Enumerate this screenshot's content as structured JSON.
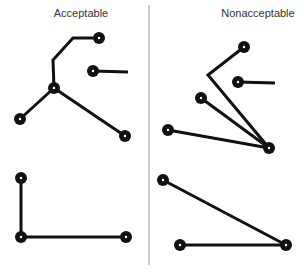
{
  "panels": {
    "left": {
      "title": "Acceptable"
    },
    "right": {
      "title": "Nonacceptable"
    }
  },
  "colors": {
    "line": "#111111",
    "divider": "#999999",
    "node_center": "#ffffff",
    "text": "#333333"
  },
  "diagram": {
    "divider": {
      "x": 149,
      "y1": 5,
      "y2": 265
    },
    "node_radius": 6,
    "line_width": 3,
    "groups": [
      {
        "panel": "left",
        "position": "top",
        "nodes": [
          [
            99,
            38
          ],
          [
            93,
            71
          ],
          [
            54,
            88
          ],
          [
            20,
            119
          ],
          [
            125,
            136
          ]
        ],
        "paths": [
          [
            [
              99,
              38
            ],
            [
              73,
              38
            ],
            [
              53,
              60
            ],
            [
              54,
              88
            ]
          ],
          [
            [
              93,
              71
            ],
            [
              128,
              72
            ]
          ],
          [
            [
              54,
              88
            ],
            [
              20,
              119
            ]
          ],
          [
            [
              54,
              88
            ],
            [
              125,
              136
            ]
          ]
        ]
      },
      {
        "panel": "left",
        "position": "bottom",
        "nodes": [
          [
            21,
            178
          ],
          [
            21,
            237
          ],
          [
            126,
            237
          ]
        ],
        "paths": [
          [
            [
              21,
              178
            ],
            [
              21,
              237
            ]
          ],
          [
            [
              21,
              237
            ],
            [
              126,
              237
            ]
          ]
        ]
      },
      {
        "panel": "right",
        "position": "top",
        "nodes": [
          [
            244,
            47
          ],
          [
            238,
            82
          ],
          [
            201,
            98
          ],
          [
            168,
            130
          ],
          [
            269,
            148
          ]
        ],
        "paths": [
          [
            [
              244,
              47
            ],
            [
              208,
              75
            ],
            [
              269,
              148
            ]
          ],
          [
            [
              238,
              82
            ],
            [
              275,
              83
            ]
          ],
          [
            [
              201,
              98
            ],
            [
              269,
              148
            ]
          ],
          [
            [
              168,
              130
            ],
            [
              269,
              148
            ]
          ]
        ]
      },
      {
        "panel": "right",
        "position": "bottom",
        "nodes": [
          [
            163,
            180
          ],
          [
            180,
            245
          ],
          [
            286,
            245
          ]
        ],
        "paths": [
          [
            [
              163,
              180
            ],
            [
              286,
              245
            ]
          ],
          [
            [
              180,
              245
            ],
            [
              286,
              245
            ]
          ]
        ]
      }
    ]
  }
}
